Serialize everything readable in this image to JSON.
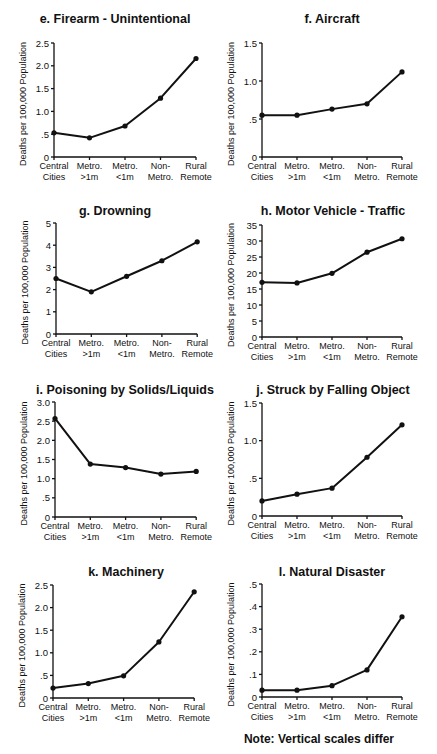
{
  "figure": {
    "note": "Note: Vertical scales differ",
    "y_axis_label": "Deaths per 100,000 Population",
    "categories": [
      [
        "Central",
        "Cities"
      ],
      [
        "Metro.",
        ">1m"
      ],
      [
        "Metro.",
        "<1m"
      ],
      [
        "Non-",
        "Metro."
      ],
      [
        "Rural",
        "Remote"
      ]
    ]
  },
  "chart_data": [
    {
      "type": "line",
      "title": "e. Firearm - Unintentional",
      "categories": [
        "Central Cities",
        "Metro. >1m",
        "Metro. <1m",
        "Non-Metro.",
        "Rural Remote"
      ],
      "values": [
        0.53,
        0.42,
        0.68,
        1.29,
        2.16
      ],
      "xlabel": "",
      "ylabel": "Deaths per 100,000 Population",
      "ylim": [
        0,
        2.5
      ],
      "yticks": [
        "0",
        ".5",
        "1.0",
        "1.5",
        "2.0",
        "2.5"
      ],
      "ytick_values": [
        0,
        0.5,
        1.0,
        1.5,
        2.0,
        2.5
      ],
      "grid": false,
      "layout": {
        "x0": 54,
        "dx": 35.5,
        "ytop": 43,
        "ybot": 157,
        "title_x": 115,
        "title_y": 23
      }
    },
    {
      "type": "line",
      "title": "f. Aircraft",
      "categories": [
        "Central Cities",
        "Metro. >1m",
        "Metro. <1m",
        "Non-Metro.",
        "Rural Remote"
      ],
      "values": [
        0.55,
        0.55,
        0.63,
        0.7,
        1.12
      ],
      "xlabel": "",
      "ylabel": "Deaths per 100,000 Population",
      "ylim": [
        0,
        1.5
      ],
      "yticks": [
        "0",
        ".5",
        "1.0",
        "1.5"
      ],
      "ytick_values": [
        0,
        0.5,
        1.0,
        1.5
      ],
      "grid": false,
      "layout": {
        "x0": 262,
        "dx": 35,
        "ytop": 43,
        "ybot": 157,
        "title_x": 332,
        "title_y": 23
      }
    },
    {
      "type": "line",
      "title": "g. Drowning",
      "categories": [
        "Central Cities",
        "Metro. >1m",
        "Metro. <1m",
        "Non-Metro.",
        "Rural Remote"
      ],
      "values": [
        2.5,
        1.9,
        2.6,
        3.3,
        4.15
      ],
      "xlabel": "",
      "ylabel": "Deaths per 100,000 Population",
      "ylim": [
        0,
        5
      ],
      "yticks": [
        "0",
        "1",
        "2",
        "3",
        "4",
        "5"
      ],
      "ytick_values": [
        0,
        1,
        2,
        3,
        4,
        5
      ],
      "grid": false,
      "layout": {
        "x0": 56,
        "dx": 35.3,
        "ytop": 223,
        "ybot": 334,
        "title_x": 115,
        "title_y": 215
      }
    },
    {
      "type": "line",
      "title": "h. Motor Vehicle - Traffic",
      "categories": [
        "Central Cities",
        "Metro. >1m",
        "Metro. <1m",
        "Non-Metro.",
        "Rural Remote"
      ],
      "values": [
        17.1,
        16.9,
        19.9,
        26.5,
        30.7
      ],
      "xlabel": "",
      "ylabel": "Deaths per 100,000 Population",
      "ylim": [
        0,
        35
      ],
      "yticks": [
        "0",
        "5",
        "10",
        "15",
        "20",
        "25",
        "30",
        "35"
      ],
      "ytick_values": [
        0,
        5,
        10,
        15,
        20,
        25,
        30,
        35
      ],
      "grid": false,
      "layout": {
        "x0": 262,
        "dx": 35,
        "ytop": 225,
        "ybot": 337,
        "title_x": 333,
        "title_y": 215
      }
    },
    {
      "type": "line",
      "title": "i. Poisoning by Solids/Liquids",
      "categories": [
        "Central Cities",
        "Metro. >1m",
        "Metro. <1m",
        "Non-Metro.",
        "Rural Remote"
      ],
      "values": [
        2.57,
        1.38,
        1.29,
        1.12,
        1.19
      ],
      "xlabel": "",
      "ylabel": "Deaths per 100,000 Population",
      "ylim": [
        0,
        3.0
      ],
      "yticks": [
        "0",
        ".5",
        "1.0",
        "1.5",
        "2.0",
        "2.5",
        "3.0"
      ],
      "ytick_values": [
        0,
        0.5,
        1.0,
        1.5,
        2.0,
        2.5,
        3.0
      ],
      "grid": false,
      "layout": {
        "x0": 55,
        "dx": 35.3,
        "ytop": 402,
        "ybot": 517,
        "title_x": 125,
        "title_y": 394
      }
    },
    {
      "type": "line",
      "title": "j. Struck by Falling Object",
      "categories": [
        "Central Cities",
        "Metro. >1m",
        "Metro. <1m",
        "Non-Metro.",
        "Rural Remote"
      ],
      "values": [
        0.2,
        0.29,
        0.37,
        0.78,
        1.21
      ],
      "xlabel": "",
      "ylabel": "Deaths per 100,000 Population",
      "ylim": [
        0,
        1.5
      ],
      "yticks": [
        "0",
        ".5",
        "1.0",
        "1.5"
      ],
      "ytick_values": [
        0,
        0.5,
        1.0,
        1.5
      ],
      "grid": false,
      "layout": {
        "x0": 262,
        "dx": 35,
        "ytop": 403,
        "ybot": 516,
        "title_x": 333,
        "title_y": 394
      }
    },
    {
      "type": "line",
      "title": "k. Machinery",
      "categories": [
        "Central Cities",
        "Metro. >1m",
        "Metro. <1m",
        "Non-Metro.",
        "Rural Remote"
      ],
      "values": [
        0.22,
        0.32,
        0.49,
        1.24,
        2.35
      ],
      "xlabel": "",
      "ylabel": "Deaths per 100,000 Population",
      "ylim": [
        0,
        2.5
      ],
      "yticks": [
        "0",
        ".5",
        "1.0",
        "1.5",
        "2.0",
        "2.5"
      ],
      "ytick_values": [
        0,
        0.5,
        1.0,
        1.5,
        2.0,
        2.5
      ],
      "grid": false,
      "layout": {
        "x0": 53,
        "dx": 35.3,
        "ytop": 585,
        "ybot": 698,
        "title_x": 126,
        "title_y": 576
      }
    },
    {
      "type": "line",
      "title": "l. Natural Disaster",
      "categories": [
        "Central Cities",
        "Metro. >1m",
        "Metro. <1m",
        "Non-Metro.",
        "Rural Remote"
      ],
      "values": [
        0.03,
        0.03,
        0.05,
        0.12,
        0.355
      ],
      "xlabel": "",
      "ylabel": "Deaths per 100,000 Population",
      "ylim": [
        0,
        0.5
      ],
      "yticks": [
        "0",
        ".1",
        ".2",
        ".3",
        ".4",
        ".5"
      ],
      "ytick_values": [
        0,
        0.1,
        0.2,
        0.3,
        0.4,
        0.5
      ],
      "grid": false,
      "layout": {
        "x0": 262,
        "dx": 35,
        "ytop": 584,
        "ybot": 697,
        "title_x": 332,
        "title_y": 576
      }
    }
  ]
}
